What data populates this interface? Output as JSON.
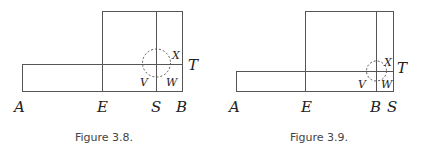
{
  "figures": [
    {
      "caption": "Figure 3.8.",
      "labels": {
        "A": "A",
        "E": "E",
        "S": "S",
        "B": "B",
        "T": "T",
        "X": "X",
        "V": "V",
        "W": "W"
      }
    },
    {
      "caption": "Figure 3.9.",
      "labels": {
        "A": "A",
        "E": "E",
        "B": "B",
        "S": "S",
        "T": "T",
        "X": "X",
        "V": "V",
        "W": "W"
      }
    }
  ]
}
